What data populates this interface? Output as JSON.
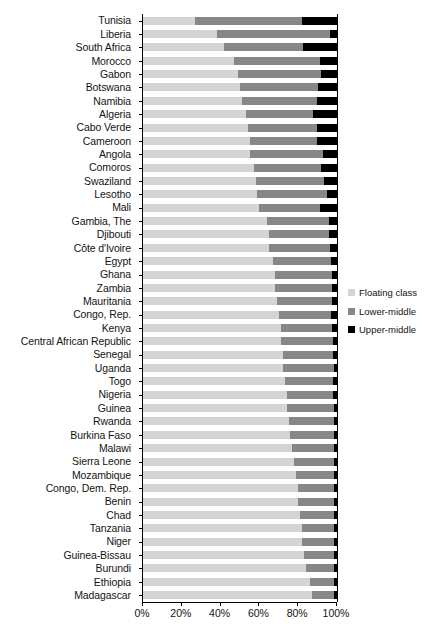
{
  "chart_data": {
    "type": "bar",
    "orientation": "horizontal",
    "stacked": true,
    "normalized": true,
    "title": "",
    "xlabel": "",
    "ylabel": "",
    "xlim": [
      0,
      100
    ],
    "grid": false,
    "legend_position": "right",
    "xtick_labels": [
      "0%",
      "20%",
      "40%",
      "60%",
      "80%",
      "100%"
    ],
    "xtick_values": [
      0,
      20,
      40,
      60,
      80,
      100
    ],
    "legend": [
      {
        "name": "Floating class",
        "color": "#d4d4d4"
      },
      {
        "name": "Lower-middle",
        "color": "#878787"
      },
      {
        "name": "Upper-middle",
        "color": "#000000"
      }
    ],
    "categories": [
      "Tunisia",
      "Liberia",
      "South Africa",
      "Morocco",
      "Gabon",
      "Botswana",
      "Namibia",
      "Algeria",
      "Cabo Verde",
      "Cameroon",
      "Angola",
      "Comoros",
      "Swaziland",
      "Lesotho",
      "Mali",
      "Gambia, The",
      "Djibouti",
      "Côte d'Ivoire",
      "Egypt",
      "Ghana",
      "Zambia",
      "Mauritania",
      "Congo, Rep.",
      "Kenya",
      "Central African Republic",
      "Senegal",
      "Uganda",
      "Togo",
      "Nigeria",
      "Guinea",
      "Rwanda",
      "Burkina Faso",
      "Malawi",
      "Sierra Leone",
      "Mozambique",
      "Congo, Dem. Rep.",
      "Benin",
      "Chad",
      "Tanzania",
      "Niger",
      "Guinea-Bissau",
      "Burundi",
      "Ethiopia",
      "Madagascar"
    ],
    "series": [
      {
        "name": "Floating class",
        "color": "#d4d4d4",
        "values": [
          27,
          38,
          42,
          47,
          49,
          50,
          51,
          53,
          54,
          55,
          55,
          57,
          58,
          59,
          60,
          64,
          65,
          65,
          67,
          68,
          68,
          69,
          70,
          71,
          71,
          72,
          72,
          73,
          74,
          74,
          75,
          76,
          77,
          78,
          79,
          80,
          80,
          81,
          82,
          82,
          83,
          84,
          86,
          87
        ]
      },
      {
        "name": "Lower-middle",
        "color": "#878787",
        "values": [
          55,
          58.5,
          40.5,
          44,
          43,
          40,
          38.5,
          34.5,
          35.5,
          34.5,
          38,
          35,
          35.5,
          36,
          31,
          32,
          31,
          31.5,
          30,
          29.5,
          29.5,
          28.5,
          27,
          26.5,
          27,
          26,
          26.5,
          25,
          24,
          24.5,
          23.5,
          22.5,
          21.5,
          20.5,
          19.5,
          18.5,
          18.5,
          17.5,
          16.5,
          16.5,
          15.5,
          14.5,
          12.5,
          11.5
        ]
      },
      {
        "name": "Upper-middle",
        "color": "#000000",
        "values": [
          18,
          3.5,
          17.5,
          9,
          8,
          10,
          10.5,
          12.5,
          10.5,
          10.5,
          7,
          8,
          6.5,
          5,
          9,
          4,
          4,
          3.5,
          3,
          2.5,
          2.5,
          2.5,
          3,
          2.5,
          2,
          2,
          1.5,
          2,
          2,
          1.5,
          1.5,
          1.5,
          1.5,
          1.5,
          1.5,
          1.5,
          1.5,
          1.5,
          1.5,
          1.5,
          1.5,
          1.5,
          1.5,
          1.5
        ]
      }
    ]
  }
}
